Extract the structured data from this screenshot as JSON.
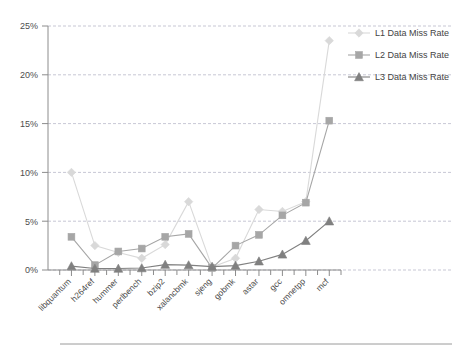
{
  "chart_data": {
    "type": "line",
    "title": "",
    "subtitle": "",
    "xlabel": "",
    "ylabel": "",
    "ylim": [
      0,
      25
    ],
    "ytick_values": [
      0,
      5,
      10,
      15,
      20,
      25
    ],
    "ytick_labels": [
      "0%",
      "5%",
      "10%",
      "15%",
      "20%",
      "25%"
    ],
    "grid": true,
    "grid_axis": "y",
    "legend_position": "top-right",
    "categories": [
      "libquantum",
      "h264ref",
      "hummer",
      "perlbench",
      "bzip2",
      "xalancbmk",
      "sjeng",
      "gobmk",
      "astar",
      "gcc",
      "omnetpp",
      "mcf"
    ],
    "series": [
      {
        "name": "L1 Data Miss Rate",
        "marker": "diamond",
        "color": "#d9d9d9",
        "values": [
          10.0,
          2.5,
          1.8,
          1.2,
          2.6,
          7.0,
          0.3,
          1.2,
          6.2,
          6.0,
          7.0,
          23.5
        ]
      },
      {
        "name": "L2 Data Miss Rate",
        "marker": "square",
        "color": "#a6a6a6",
        "values": [
          3.4,
          0.5,
          1.9,
          2.2,
          3.4,
          3.7,
          0.2,
          2.5,
          3.6,
          5.6,
          6.9,
          15.3
        ]
      },
      {
        "name": "L3 Data Miss Rate",
        "marker": "triangle",
        "color": "#808080",
        "values": [
          0.4,
          0.15,
          0.15,
          0.2,
          0.55,
          0.5,
          0.35,
          0.45,
          0.9,
          1.6,
          3.0,
          5.0
        ]
      }
    ]
  },
  "legend": {
    "items": [
      {
        "label": "L1 Data Miss Rate",
        "marker": "diamond",
        "color": "#d9d9d9"
      },
      {
        "label": "L2 Data Miss Rate",
        "marker": "square",
        "color": "#a6a6a6"
      },
      {
        "label": "L3 Data Miss Rate",
        "marker": "triangle",
        "color": "#808080"
      }
    ]
  },
  "colors": {
    "background": "#ffffff",
    "axis": "#8c8c8c",
    "grid": "#b9b9c9",
    "text": "#4d4d4d",
    "l1": "#d9d9d9",
    "l2": "#a6a6a6",
    "l3": "#808080"
  }
}
